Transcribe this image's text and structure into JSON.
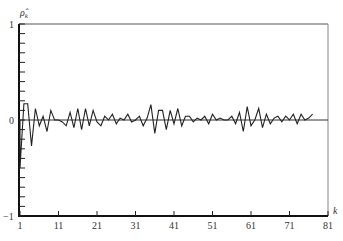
{
  "chart_data": {
    "type": "line",
    "title": "",
    "xlabel": "k",
    "ylabel": "ρ̂_k",
    "ylim": [
      -1,
      1
    ],
    "xlim": [
      1,
      81
    ],
    "grid": false,
    "legend": null,
    "y_ticks": [
      "1",
      "0",
      "−1"
    ],
    "x_ticks": [
      "1",
      "11",
      "21",
      "31",
      "41",
      "51",
      "61",
      "71",
      "81"
    ],
    "x": [
      1,
      2,
      3,
      4,
      5,
      6,
      7,
      8,
      9,
      10,
      11,
      12,
      13,
      14,
      15,
      16,
      17,
      18,
      19,
      20,
      21,
      22,
      23,
      24,
      25,
      26,
      27,
      28,
      29,
      30,
      31,
      32,
      33,
      34,
      35,
      36,
      37,
      38,
      39,
      40,
      41,
      42,
      43,
      44,
      45,
      46,
      47,
      48,
      49,
      50,
      51,
      52,
      53,
      54,
      55,
      56,
      57,
      58,
      59,
      60,
      61,
      62,
      63,
      64,
      65,
      66,
      67,
      68,
      69,
      70,
      71,
      72,
      73,
      74,
      75,
      76,
      77
    ],
    "values": [
      -0.5,
      0.17,
      0.17,
      -0.27,
      0.12,
      -0.06,
      0.04,
      -0.12,
      0.1,
      0.0,
      0.0,
      -0.02,
      -0.06,
      0.08,
      -0.08,
      0.12,
      -0.1,
      0.12,
      -0.06,
      0.1,
      -0.02,
      -0.06,
      0.04,
      0.0,
      0.06,
      -0.04,
      0.02,
      0.0,
      0.06,
      -0.02,
      0.0,
      0.04,
      -0.06,
      0.02,
      0.16,
      -0.14,
      0.1,
      0.1,
      -0.1,
      0.1,
      -0.04,
      0.12,
      -0.06,
      0.04,
      0.04,
      -0.02,
      0.02,
      0.0,
      0.04,
      -0.04,
      0.06,
      0.0,
      0.02,
      0.0,
      0.0,
      0.04,
      -0.04,
      0.08,
      -0.12,
      0.14,
      -0.06,
      0.0,
      0.12,
      -0.08,
      0.06,
      -0.04,
      0.02,
      0.04,
      -0.02,
      0.04,
      0.0,
      0.06,
      -0.04,
      0.06,
      0.0,
      0.02,
      0.06
    ]
  }
}
